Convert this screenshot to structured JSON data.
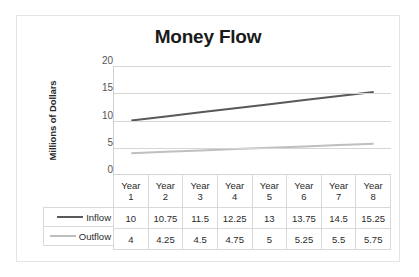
{
  "chart_data": {
    "type": "line",
    "title": "Money Flow",
    "xlabel": "",
    "ylabel": "Millions of Dollars",
    "categories": [
      "Year 1",
      "Year 2",
      "Year 3",
      "Year 4",
      "Year 5",
      "Year 6",
      "Year 7",
      "Year 8"
    ],
    "category_lines": [
      [
        "Year",
        "1"
      ],
      [
        "Year",
        "2"
      ],
      [
        "Year",
        "3"
      ],
      [
        "Year",
        "4"
      ],
      [
        "Year",
        "5"
      ],
      [
        "Year",
        "6"
      ],
      [
        "Year",
        "7"
      ],
      [
        "Year",
        "8"
      ]
    ],
    "series": [
      {
        "name": "Inflow",
        "color": "#595959",
        "values": [
          10,
          10.75,
          11.5,
          12.25,
          13,
          13.75,
          14.5,
          15.25
        ],
        "labels": [
          "10",
          "10.75",
          "11.5",
          "12.25",
          "13",
          "13.75",
          "14.5",
          "15.25"
        ]
      },
      {
        "name": "Outflow",
        "color": "#bfbfbf",
        "values": [
          4,
          4.25,
          4.5,
          4.75,
          5,
          5.25,
          5.5,
          5.75
        ],
        "labels": [
          "4",
          "4.25",
          "4.5",
          "4.75",
          "5",
          "5.25",
          "5.5",
          "5.75"
        ]
      }
    ],
    "ylim": [
      0,
      20
    ],
    "yticks": [
      20,
      15,
      10,
      5,
      0
    ],
    "ytick_labels": [
      "20",
      "15",
      "10",
      "5",
      "0"
    ],
    "grid": true,
    "legend_position": "data-table-left",
    "has_data_table": true
  },
  "frame": {
    "border_color": "#e4e4e4",
    "background": "#ffffff"
  }
}
